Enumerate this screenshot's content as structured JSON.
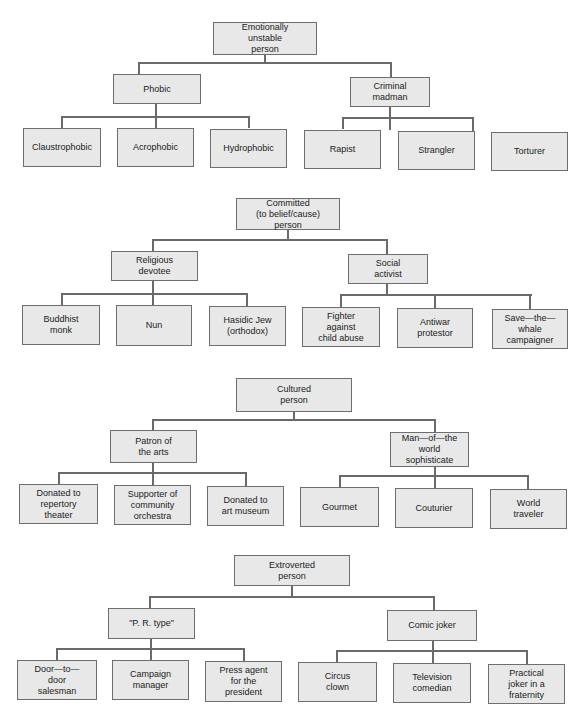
{
  "trees": [
    {
      "root": "Emotionally\nunstable\nperson",
      "branches": [
        {
          "label": "Phobic",
          "leaves": [
            "Claustrophobic",
            "Acrophobic",
            "Hydrophobic"
          ]
        },
        {
          "label": "Criminal\nmadman",
          "leaves": [
            "Rapist",
            "Strangler",
            "Torturer"
          ]
        }
      ]
    },
    {
      "root": "Committed\n(to belief/cause)\nperson",
      "branches": [
        {
          "label": "Religious\ndevotee",
          "leaves": [
            "Buddhist\nmonk",
            "Nun",
            "Hasidic Jew\n(orthodox)"
          ]
        },
        {
          "label": "Social\nactivist",
          "leaves": [
            "Fighter\nagainst\nchild abuse",
            "Antiwar\nprotestor",
            "Save—the—\nwhale\ncampaigner"
          ]
        }
      ]
    },
    {
      "root": "Cultured\nperson",
      "branches": [
        {
          "label": "Patron of\nthe arts",
          "leaves": [
            "Donated to\nrepertory\ntheater",
            "Supporter of\ncommunity\norchestra",
            "Donated to\nart museum"
          ]
        },
        {
          "label": "Man—of—the\nworld\nsophisticate",
          "leaves": [
            "Gourmet",
            "Couturier",
            "World\ntraveler"
          ]
        }
      ]
    },
    {
      "root": "Extroverted\nperson",
      "branches": [
        {
          "label": "\"P. R. type\"",
          "leaves": [
            "Door—to—\ndoor\nsalesman",
            "Campaign\nmanager",
            "Press agent\nfor the\npresident"
          ]
        },
        {
          "label": "Comic joker",
          "leaves": [
            "Circus\nclown",
            "Television\ncomedian",
            "Practical\njoker in a\nfraternity"
          ]
        }
      ]
    }
  ]
}
